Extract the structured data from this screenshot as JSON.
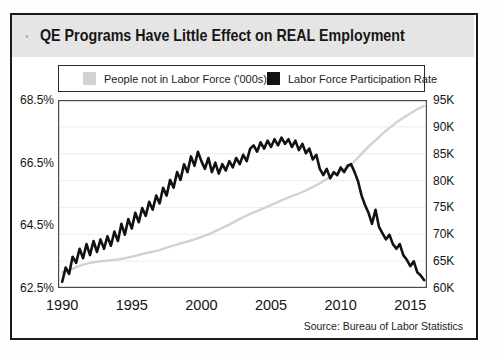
{
  "header": {
    "title": "QE Programs Have Little Effect on REAL Employment",
    "icon": "gear-icon",
    "background": "#e5e5e5"
  },
  "source_note": "Source: Bureau of Labor Statistics",
  "chart_data": {
    "type": "line",
    "title": "QE Programs Have Little Effect on REAL Employment",
    "legend_position": "top",
    "grid": "faint-horizontal",
    "x_axis": {
      "ticks": [
        1990,
        1995,
        2000,
        2005,
        2010,
        2015
      ],
      "range": [
        1989.7,
        2016.2
      ]
    },
    "y_axis_left": {
      "series": "Labor Force Participation Rate",
      "unit": "%",
      "tick_labels": [
        "68.5%",
        "66.5%",
        "64.5%",
        "62.5%"
      ],
      "tick_values": [
        68.5,
        66.5,
        64.5,
        62.5
      ],
      "range": [
        62.5,
        68.5
      ]
    },
    "y_axis_right": {
      "series": "People not in Labor Force ('000s)",
      "unit": "K",
      "tick_labels": [
        "95K",
        "90K",
        "85K",
        "80K",
        "75K",
        "70K",
        "65K",
        "60K"
      ],
      "tick_values": [
        95,
        90,
        85,
        80,
        75,
        70,
        65,
        60
      ],
      "range": [
        60,
        95
      ]
    },
    "gridlines": {
      "axis": "right",
      "values": [
        90,
        85,
        80,
        75,
        70,
        65
      ],
      "color": "#ededed"
    },
    "series": [
      {
        "name": "People not in Labor Force ('000s)",
        "axis": "right",
        "color": "#d2d2d2",
        "stroke_width": 2.4,
        "x_start": 1990,
        "x_step": 0.5,
        "values": [
          62.9,
          63.3,
          63.9,
          64.35,
          64.7,
          64.9,
          65.05,
          65.15,
          65.3,
          65.55,
          65.85,
          66.15,
          66.5,
          66.75,
          67.05,
          67.5,
          67.9,
          68.3,
          68.65,
          69.05,
          69.5,
          70.0,
          70.6,
          71.2,
          71.8,
          72.5,
          73.2,
          73.8,
          74.3,
          74.85,
          75.45,
          76.05,
          76.6,
          77.1,
          77.6,
          78.15,
          78.8,
          79.5,
          80.3,
          81.2,
          81.7,
          82.4,
          83.6,
          85.0,
          86.3,
          87.5,
          88.7,
          89.8,
          90.8,
          91.7,
          92.5,
          93.3,
          93.9
        ]
      },
      {
        "name": "Labor Force Participation Rate",
        "axis": "left",
        "color": "#121212",
        "stroke_width": 2.6,
        "x_start": 1990,
        "x_step": 0.25,
        "values": [
          62.7,
          63.15,
          62.95,
          63.5,
          63.3,
          63.75,
          63.45,
          63.9,
          63.55,
          64.0,
          63.65,
          64.05,
          63.75,
          64.15,
          63.85,
          64.3,
          64.0,
          64.55,
          64.2,
          64.7,
          64.4,
          64.9,
          64.6,
          65.05,
          64.8,
          65.25,
          65.0,
          65.45,
          65.2,
          65.7,
          65.45,
          65.95,
          65.7,
          66.2,
          65.95,
          66.45,
          66.2,
          66.7,
          66.4,
          66.85,
          66.55,
          66.3,
          66.65,
          66.2,
          66.5,
          66.15,
          66.45,
          66.25,
          66.55,
          66.35,
          66.65,
          66.45,
          66.75,
          66.55,
          66.95,
          67.05,
          66.85,
          67.15,
          66.95,
          67.2,
          67.0,
          67.25,
          67.05,
          67.3,
          67.1,
          67.25,
          67.0,
          67.2,
          66.9,
          67.1,
          66.8,
          66.95,
          66.6,
          66.75,
          66.3,
          66.1,
          66.3,
          66.0,
          66.2,
          66.1,
          66.35,
          66.2,
          66.4,
          66.45,
          66.2,
          65.9,
          65.45,
          65.15,
          64.9,
          64.55,
          65.0,
          64.45,
          64.25,
          64.05,
          64.2,
          63.9,
          63.75,
          63.9,
          63.55,
          63.4,
          63.2,
          63.35,
          63.0,
          62.9,
          62.75
        ]
      }
    ]
  }
}
